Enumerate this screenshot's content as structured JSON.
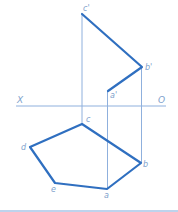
{
  "diagram": {
    "type": "orthographic-projection",
    "axis": {
      "left_label": "X",
      "right_label": "O",
      "y": 106,
      "x1": 16,
      "x2": 166
    },
    "colors": {
      "bold_line": "#2f6fc0",
      "projection_line": "#8fb0dd",
      "label": "#7e9fcc",
      "bottom_rule": "#a8c4e6"
    },
    "front_view": {
      "points": [
        {
          "label": "c'",
          "x": 82,
          "y": 14
        },
        {
          "label": "b'",
          "x": 142,
          "y": 67
        },
        {
          "label": "a'",
          "x": 108,
          "y": 91
        }
      ]
    },
    "top_view": {
      "points": [
        {
          "label": "c",
          "x": 82,
          "y": 124
        },
        {
          "label": "b",
          "x": 141,
          "y": 163
        },
        {
          "label": "a",
          "x": 107,
          "y": 189
        },
        {
          "label": "e",
          "x": 55,
          "y": 183
        },
        {
          "label": "d",
          "x": 30,
          "y": 147
        }
      ]
    },
    "labels": {
      "c_prime": "c'",
      "b_prime": "b'",
      "a_prime": "a'",
      "c": "c",
      "b": "b",
      "a": "a",
      "e": "e",
      "d": "d",
      "x_axis": "X",
      "o_axis": "O"
    }
  }
}
